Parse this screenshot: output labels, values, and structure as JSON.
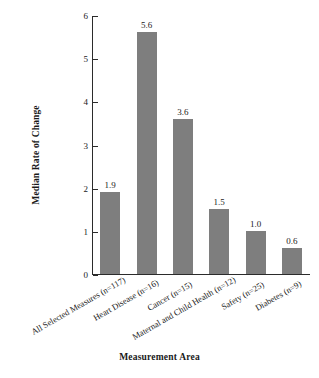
{
  "chart_data": {
    "type": "bar",
    "title": "",
    "xlabel": "Measurement Area",
    "ylabel": "Median Rate of Change",
    "categories": [
      "All Selected Measures (n=117)",
      "Heart Disease (n=16)",
      "Cancer (n=15)",
      "Maternal and Child Health (n=12)",
      "Safety (n=25)",
      "Diabetes (n=9)"
    ],
    "values": [
      1.9,
      5.6,
      3.6,
      1.5,
      1.0,
      0.6
    ],
    "value_labels": [
      "1.9",
      "5.6",
      "3.6",
      "1.5",
      "1.0",
      "0.6"
    ],
    "ylim": [
      0,
      6
    ],
    "yticks": [
      0,
      1,
      2,
      3,
      4,
      5,
      6
    ],
    "ytick_labels": [
      "0",
      "1",
      "2",
      "3",
      "4",
      "5",
      "6"
    ],
    "grid": false,
    "legend": "none",
    "bar_color": "#7e7e7e",
    "axis_color": "#2b2b2b",
    "text_color": "#1a1a1a",
    "label_rotation_deg": -30
  }
}
